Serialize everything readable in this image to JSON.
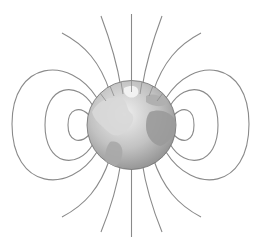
{
  "diagram": {
    "colors": {
      "background": "#ffffff",
      "field_line": "#8a8a8a",
      "globe_ocean_light": "#e6e6e6",
      "globe_ocean_dark": "#8c8c8c",
      "globe_land": "#b4b4b4",
      "globe_outline": "#6e6e6e"
    },
    "globe": {
      "cx": 131.5,
      "cy": 125,
      "r": 44.5
    },
    "field_lines": {
      "polar_count": 10,
      "loop_pairs": 3
    }
  }
}
